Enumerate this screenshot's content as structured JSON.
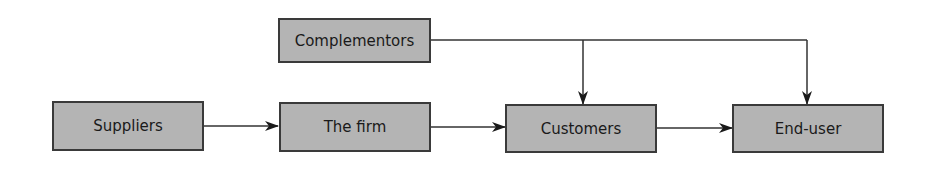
{
  "diagram": {
    "type": "flow",
    "nodes": [
      {
        "id": "complementors",
        "label": "Complementors"
      },
      {
        "id": "suppliers",
        "label": "Suppliers"
      },
      {
        "id": "firm",
        "label": "The firm"
      },
      {
        "id": "customers",
        "label": "Customers"
      },
      {
        "id": "end_user",
        "label": "End-user"
      }
    ],
    "edges": [
      {
        "from": "suppliers",
        "to": "firm"
      },
      {
        "from": "firm",
        "to": "customers"
      },
      {
        "from": "customers",
        "to": "end_user"
      },
      {
        "from": "complementors",
        "to": "customers"
      },
      {
        "from": "complementors",
        "to": "end_user"
      }
    ],
    "colors": {
      "box_fill": "#b4b4b4",
      "box_border": "#3a3a3a",
      "line": "#333333"
    }
  }
}
